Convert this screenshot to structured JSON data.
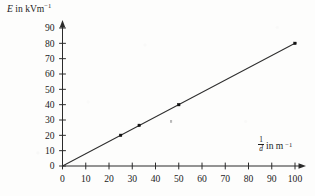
{
  "figure": {
    "background_color": "#fdfdfc",
    "ink_color": "#2b2b2b"
  },
  "axes": {
    "y": {
      "caption_quantity": "E",
      "caption_connector": " in kVm",
      "caption_exponent": "−1",
      "caption_full": "E in kVm−1",
      "tick_labels": [
        "0",
        "10",
        "20",
        "30",
        "40",
        "50",
        "60",
        "70",
        "80",
        "90"
      ]
    },
    "x": {
      "caption_numerator": "1",
      "caption_denominator": "d",
      "caption_connector": "in m",
      "caption_exponent": "−1",
      "caption_full": "1/d in m−1",
      "tick_labels": [
        "0",
        "10",
        "20",
        "30",
        "40",
        "50",
        "60",
        "70",
        "80",
        "90",
        "100"
      ]
    }
  },
  "chart_data": {
    "type": "scatter",
    "title": "",
    "subtitle": "",
    "xlabel": "1/d in m−1",
    "ylabel": "E in kVm−1",
    "xlim": [
      0,
      100
    ],
    "ylim": [
      0,
      90
    ],
    "xticks": [
      0,
      10,
      20,
      30,
      40,
      50,
      60,
      70,
      80,
      90,
      100
    ],
    "yticks": [
      0,
      10,
      20,
      30,
      40,
      50,
      60,
      70,
      80,
      90
    ],
    "grid": false,
    "legend": false,
    "legend_position": "none",
    "x": [
      25,
      33,
      50,
      100
    ],
    "y": [
      20,
      26.5,
      40,
      80
    ],
    "points": [
      {
        "x": 25,
        "y": 20
      },
      {
        "x": 33,
        "y": 26.5
      },
      {
        "x": 50,
        "y": 40
      },
      {
        "x": 100,
        "y": 80
      }
    ],
    "series": [
      {
        "name": "measured points",
        "type": "scatter",
        "marker": "square",
        "color": "#111111",
        "values": [
          20,
          26.5,
          40,
          80
        ]
      },
      {
        "name": "best fit line",
        "type": "line",
        "color": "#2f2f2f",
        "through_origin": true,
        "slope": 0.8,
        "intercept": 0,
        "endpoints": [
          {
            "x": 0,
            "y": 0
          },
          {
            "x": 100,
            "y": 80
          }
        ]
      }
    ],
    "annotations": []
  }
}
